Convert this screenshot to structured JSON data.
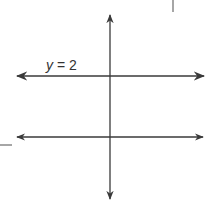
{
  "chart_data": {
    "type": "line",
    "title": "",
    "xlabel": "x",
    "ylabel": "y",
    "xlim": [
      -3,
      3
    ],
    "ylim": [
      -2,
      4
    ],
    "grid": true,
    "grid_step": 0.5,
    "x_tick_labels": [
      "−2",
      "−1",
      "1",
      "2"
    ],
    "x_ticks": [
      -2,
      -1,
      1,
      2
    ],
    "y_tick_labels": [
      "−1",
      "1",
      "2",
      "3"
    ],
    "y_ticks": [
      -1,
      1,
      2,
      3
    ],
    "origin_label": "O",
    "series": [
      {
        "name": "y = 2",
        "kind": "horizontal-line",
        "equation": "y = 2",
        "x": [
          -2.9,
          2.9
        ],
        "y": [
          2,
          2
        ],
        "arrows": "both",
        "annotation": "y = 2"
      },
      {
        "name": "parabola",
        "kind": "curve",
        "equation": "y = 1 - x^2/4",
        "vertex": [
          0,
          1
        ],
        "x_intercepts": [
          -2,
          2
        ],
        "x": [
          -3,
          -2.5,
          -2,
          -1.5,
          -1,
          -0.5,
          0,
          0.5,
          1,
          1.5,
          2,
          2.5,
          3
        ],
        "y": [
          -1.25,
          -0.5625,
          0,
          0.4375,
          0.75,
          0.9375,
          1,
          0.9375,
          0.75,
          0.4375,
          0,
          -0.5625,
          -1.25
        ],
        "arrows": "both"
      }
    ]
  },
  "labels": {
    "x_axis": "x",
    "y_axis": "y",
    "origin": "O",
    "line_annotation": "y = 2",
    "xt_m2": "−2",
    "xt_m1": "−1",
    "xt_1": "1",
    "xt_2": "2",
    "yt_3": "3",
    "yt_2": "2",
    "yt_1": "1",
    "yt_m1": "−1"
  },
  "colors": {
    "grid": "#d6d6d6",
    "axis": "#3a3a3a",
    "curve": "#444444",
    "text": "#333333"
  }
}
